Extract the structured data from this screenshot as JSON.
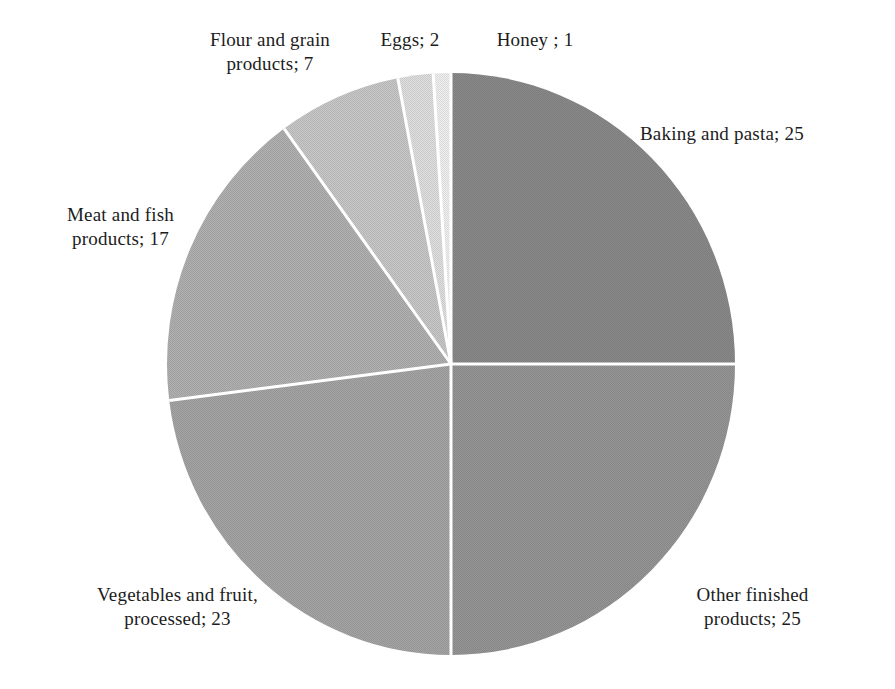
{
  "chart_data": {
    "type": "pie",
    "title": "",
    "subtitle": "",
    "xlabel": "",
    "ylabel": "",
    "legend_position": "none",
    "grid": false,
    "total": 100,
    "start_angle_deg": 0,
    "direction": "clockwise",
    "categories": [
      "Baking and pasta",
      "Other finished products",
      "Vegetables and fruit, processed",
      "Meat and fish products",
      "Flour and grain products",
      "Eggs",
      "Honey "
    ],
    "values": [
      25,
      25,
      23,
      17,
      7,
      2,
      1
    ],
    "slices": [
      {
        "name": "Baking and pasta",
        "label": "Baking and pasta; 25",
        "value": 25,
        "color": "#7d7d7d",
        "start_deg": 0,
        "sweep_deg": 90
      },
      {
        "name": "Other finished products",
        "label": "Other finished\nproducts; 25",
        "value": 25,
        "color": "#8a8a8a",
        "start_deg": 90,
        "sweep_deg": 90
      },
      {
        "name": "Vegetables and fruit, processed",
        "label": "Vegetables and fruit,\nprocessed; 23",
        "value": 23,
        "color": "#9b9b9b",
        "start_deg": 180,
        "sweep_deg": 82.8
      },
      {
        "name": "Meat and fish products",
        "label": "Meat and fish\nproducts; 17",
        "value": 17,
        "color": "#a8a8a8",
        "start_deg": 262.8,
        "sweep_deg": 61.2
      },
      {
        "name": "Flour and grain products",
        "label": "Flour and grain\nproducts; 7",
        "value": 7,
        "color": "#c2c2c2",
        "start_deg": 324.0,
        "sweep_deg": 25.2
      },
      {
        "name": "Eggs",
        "label": "Eggs; 2",
        "value": 2,
        "color": "#dcdcdc",
        "start_deg": 349.2,
        "sweep_deg": 7.2
      },
      {
        "name": "Honey",
        "label": "Honey ; 1",
        "value": 1,
        "color": "#efefef",
        "start_deg": 356.4,
        "sweep_deg": 3.6
      }
    ],
    "geometry": {
      "center_x": 451,
      "center_y": 364,
      "radius_x": 284,
      "radius_y": 291,
      "separator_color": "#ffffff",
      "separator_width": 3
    },
    "background_color": "#ffffff",
    "text_color": "#1c1c1c"
  },
  "labels": {
    "flour": "Flour and grain\nproducts; 7",
    "eggs": "Eggs; 2",
    "honey": "Honey ; 1",
    "baking": "Baking and pasta; 25",
    "meat": "Meat and fish\nproducts; 17",
    "vegetables": "Vegetables and fruit,\nprocessed; 23",
    "other": "Other finished\nproducts; 25"
  }
}
